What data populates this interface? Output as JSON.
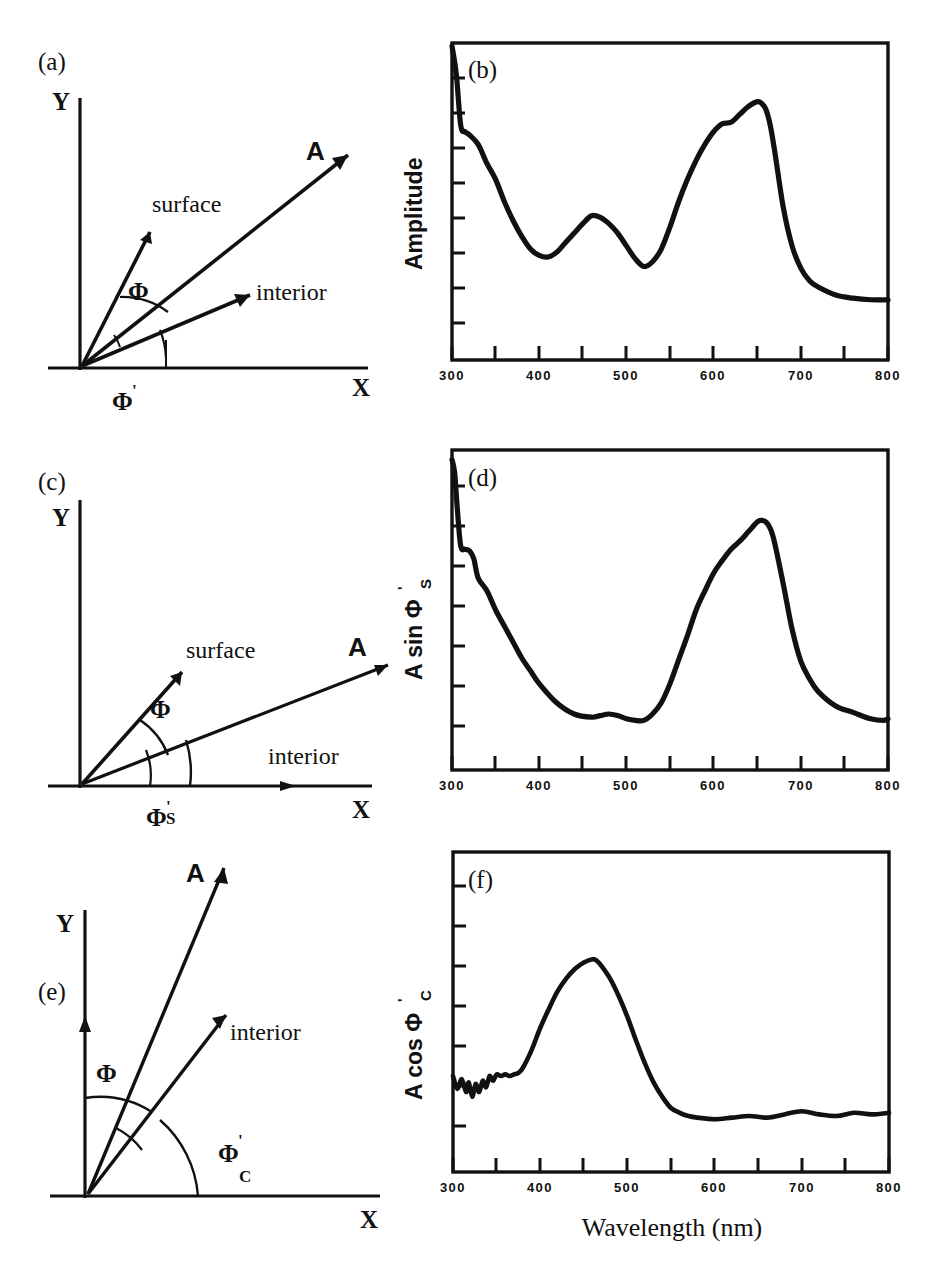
{
  "figure": {
    "xaxis_title": "Wavelength (nm)",
    "panel_tags": [
      "(a)",
      "(b)",
      "(c)",
      "(d)",
      "(e)",
      "(f)"
    ]
  },
  "diagrams": [
    {
      "tag": "(a)",
      "x_axis_label": "X",
      "y_axis_label": "Y",
      "vectors": [
        {
          "name": "surface",
          "label": "surface"
        },
        {
          "name": "resultant",
          "label": "A"
        },
        {
          "name": "interior",
          "label": "interior"
        }
      ],
      "angles": [
        {
          "name": "phi",
          "label": "Φ",
          "prime": "",
          "subscript": ""
        },
        {
          "name": "phi-prime",
          "label": "Φ",
          "prime": "'",
          "subscript": ""
        }
      ]
    },
    {
      "tag": "(c)",
      "x_axis_label": "X",
      "y_axis_label": "Y",
      "vectors": [
        {
          "name": "surface",
          "label": "surface"
        },
        {
          "name": "resultant",
          "label": "A"
        },
        {
          "name": "interior",
          "label": "interior"
        }
      ],
      "angles": [
        {
          "name": "phi",
          "label": "Φ",
          "prime": "",
          "subscript": ""
        },
        {
          "name": "phi-prime-s",
          "label": "Φ",
          "prime": "'",
          "subscript": "S"
        }
      ]
    },
    {
      "tag": "(e)",
      "x_axis_label": "X",
      "y_axis_label": "Y",
      "vectors": [
        {
          "name": "resultant",
          "label": "A"
        },
        {
          "name": "interior",
          "label": "interior"
        }
      ],
      "angles": [
        {
          "name": "phi",
          "label": "Φ",
          "prime": "",
          "subscript": ""
        },
        {
          "name": "phi-prime-c",
          "label": "Φ",
          "prime": "'",
          "subscript": "C"
        }
      ]
    }
  ],
  "chart_data": [
    {
      "type": "line",
      "tag": "(b)",
      "title": "",
      "xlabel": "",
      "ylabel": "Amplitude",
      "ylabel_parts": {
        "main": "Amplitude",
        "prime": "",
        "subscript": ""
      },
      "xlim": [
        300,
        800
      ],
      "ylim": [
        0,
        1
      ],
      "grid": false,
      "legend": "none",
      "xticks": [
        300,
        350,
        400,
        450,
        500,
        550,
        600,
        650,
        700,
        750,
        800
      ],
      "xticklabels": [
        "300",
        "",
        "400",
        "",
        "500",
        "",
        "600",
        "",
        "700",
        "",
        "800"
      ],
      "yticks_count": 9,
      "yticklabels": [],
      "x": [
        300,
        305,
        310,
        315,
        320,
        330,
        340,
        350,
        360,
        370,
        380,
        390,
        400,
        410,
        420,
        430,
        440,
        450,
        460,
        470,
        480,
        490,
        500,
        510,
        520,
        530,
        540,
        550,
        560,
        570,
        580,
        590,
        600,
        610,
        620,
        630,
        640,
        650,
        655,
        660,
        665,
        670,
        680,
        690,
        700,
        710,
        720,
        740,
        760,
        780,
        800
      ],
      "y": [
        0.99,
        0.9,
        0.74,
        0.72,
        0.71,
        0.68,
        0.62,
        0.57,
        0.5,
        0.44,
        0.39,
        0.35,
        0.33,
        0.325,
        0.34,
        0.37,
        0.4,
        0.43,
        0.455,
        0.45,
        0.43,
        0.4,
        0.36,
        0.32,
        0.295,
        0.31,
        0.35,
        0.42,
        0.5,
        0.57,
        0.63,
        0.68,
        0.72,
        0.745,
        0.75,
        0.775,
        0.8,
        0.815,
        0.81,
        0.79,
        0.74,
        0.66,
        0.48,
        0.36,
        0.29,
        0.25,
        0.23,
        0.205,
        0.195,
        0.19,
        0.19
      ]
    },
    {
      "type": "line",
      "tag": "(d)",
      "title": "",
      "xlabel": "",
      "ylabel": "A sin Φ'S",
      "ylabel_parts": {
        "main": "A sin Φ",
        "prime": "'",
        "subscript": "S"
      },
      "xlim": [
        300,
        800
      ],
      "ylim": [
        0,
        1
      ],
      "grid": false,
      "legend": "none",
      "xticks": [
        300,
        350,
        400,
        450,
        500,
        550,
        600,
        650,
        700,
        750,
        800
      ],
      "xticklabels": [
        "300",
        "",
        "400",
        "",
        "500",
        "",
        "600",
        "",
        "700",
        "",
        "800"
      ],
      "yticks_count": 8,
      "yticklabels": [],
      "x": [
        300,
        303,
        306,
        310,
        315,
        320,
        325,
        330,
        340,
        350,
        360,
        370,
        380,
        390,
        400,
        420,
        440,
        460,
        470,
        480,
        490,
        500,
        510,
        520,
        530,
        540,
        550,
        560,
        570,
        580,
        590,
        600,
        610,
        620,
        630,
        640,
        650,
        655,
        660,
        665,
        670,
        680,
        690,
        700,
        710,
        720,
        740,
        760,
        780,
        795,
        800
      ],
      "y": [
        0.97,
        0.93,
        0.82,
        0.7,
        0.69,
        0.685,
        0.66,
        0.6,
        0.56,
        0.5,
        0.45,
        0.4,
        0.35,
        0.31,
        0.27,
        0.21,
        0.175,
        0.165,
        0.17,
        0.175,
        0.17,
        0.16,
        0.155,
        0.155,
        0.175,
        0.21,
        0.27,
        0.345,
        0.42,
        0.5,
        0.56,
        0.615,
        0.655,
        0.69,
        0.715,
        0.745,
        0.775,
        0.78,
        0.775,
        0.755,
        0.71,
        0.58,
        0.44,
        0.34,
        0.285,
        0.245,
        0.2,
        0.18,
        0.16,
        0.155,
        0.16
      ]
    },
    {
      "type": "line",
      "tag": "(f)",
      "title": "",
      "xlabel": "Wavelength (nm)",
      "ylabel": "A cos Φ'C",
      "ylabel_parts": {
        "main": "A cos Φ",
        "prime": "'",
        "subscript": "C"
      },
      "xlim": [
        300,
        800
      ],
      "ylim": [
        0,
        1
      ],
      "grid": false,
      "legend": "none",
      "xticks": [
        300,
        350,
        400,
        450,
        500,
        550,
        600,
        650,
        700,
        750,
        800
      ],
      "xticklabels": [
        "300",
        "",
        "400",
        "",
        "500",
        "",
        "600",
        "",
        "700",
        "",
        "800"
      ],
      "yticks_count": 8,
      "yticklabels": [],
      "x": [
        300,
        305,
        310,
        315,
        318,
        322,
        326,
        330,
        334,
        338,
        342,
        346,
        350,
        355,
        360,
        365,
        370,
        375,
        380,
        390,
        400,
        410,
        420,
        430,
        440,
        450,
        460,
        465,
        470,
        480,
        490,
        500,
        510,
        520,
        530,
        540,
        550,
        560,
        570,
        580,
        600,
        620,
        640,
        660,
        680,
        700,
        720,
        740,
        760,
        780,
        800
      ],
      "y": [
        0.3,
        0.26,
        0.29,
        0.25,
        0.28,
        0.235,
        0.275,
        0.25,
        0.285,
        0.265,
        0.3,
        0.285,
        0.305,
        0.3,
        0.305,
        0.3,
        0.305,
        0.31,
        0.325,
        0.38,
        0.45,
        0.51,
        0.565,
        0.605,
        0.635,
        0.655,
        0.665,
        0.66,
        0.645,
        0.605,
        0.55,
        0.485,
        0.41,
        0.34,
        0.28,
        0.235,
        0.2,
        0.185,
        0.175,
        0.17,
        0.165,
        0.17,
        0.175,
        0.17,
        0.18,
        0.19,
        0.18,
        0.175,
        0.185,
        0.18,
        0.185
      ]
    }
  ]
}
